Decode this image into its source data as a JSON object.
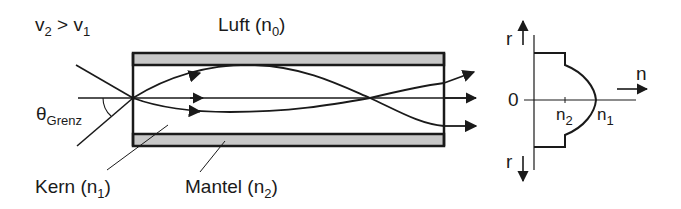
{
  "diagram": {
    "type": "optical-fiber-graded-index",
    "colors": {
      "ink": "#1a1a1a",
      "cladding_fill": "#c8c8c8",
      "background": "#ffffff"
    },
    "labels": {
      "velocity_relation": {
        "v": "v",
        "sub_left": "2",
        "op": " > ",
        "v2": "v",
        "sub_right": "1"
      },
      "air": {
        "text": "Luft (n",
        "sub": "0",
        "close": ")"
      },
      "acceptance_angle": {
        "symbol": "θ",
        "sub": "Grenz"
      },
      "core": {
        "text": "Kern (n",
        "sub": "1",
        "close": ")"
      },
      "cladding": {
        "text": "Mantel (n",
        "sub": "2",
        "close": ")"
      }
    },
    "profile": {
      "axis_r_top": "r",
      "axis_r_bottom": "r",
      "axis_n": "n",
      "origin": "0",
      "tick_n2": {
        "text": "n",
        "sub": "2"
      },
      "tick_n1": {
        "text": "n",
        "sub": "1"
      }
    }
  }
}
